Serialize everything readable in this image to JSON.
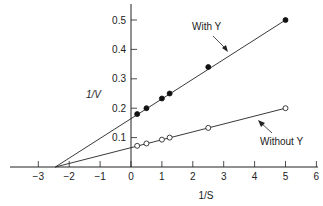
{
  "chart_data": {
    "type": "line",
    "title": "",
    "xlabel": "1/S",
    "ylabel": "1/V",
    "xlim": [
      -3.8,
      6.2
    ],
    "ylim": [
      0,
      0.55
    ],
    "grid": false,
    "x_ticks": [
      -3,
      -2,
      -1,
      0,
      1,
      2,
      3,
      4,
      5,
      6
    ],
    "x_tick_labels": [
      "−3",
      "−2",
      "−1",
      "0",
      "1",
      "2",
      "3",
      "4",
      "5",
      "6"
    ],
    "y_ticks": [
      0.1,
      0.2,
      0.3,
      0.4,
      0.5
    ],
    "y_tick_labels": [
      "0.1",
      "0.2",
      "0.3",
      "0.4",
      "0.5"
    ],
    "x": [
      0.2,
      0.5,
      1.0,
      1.25,
      2.5,
      5.0
    ],
    "intercept_x": -2.45,
    "series": [
      {
        "name": "With Y",
        "marker": "filled-circle",
        "values": [
          0.18,
          0.2,
          0.233,
          0.25,
          0.34,
          0.5
        ],
        "y_intercept": 0.165
      },
      {
        "name": "Without Y",
        "marker": "open-circle",
        "values": [
          0.072,
          0.08,
          0.093,
          0.1,
          0.133,
          0.2
        ],
        "y_intercept": 0.067
      }
    ],
    "annotations": [
      {
        "text": "With Y",
        "points_to": "upper line"
      },
      {
        "text": "Without Y",
        "points_to": "lower line"
      }
    ]
  },
  "labels": {
    "xlabel": "1/S",
    "ylabel": "1/V",
    "with_y": "With Y",
    "without_y": "Without Y"
  }
}
